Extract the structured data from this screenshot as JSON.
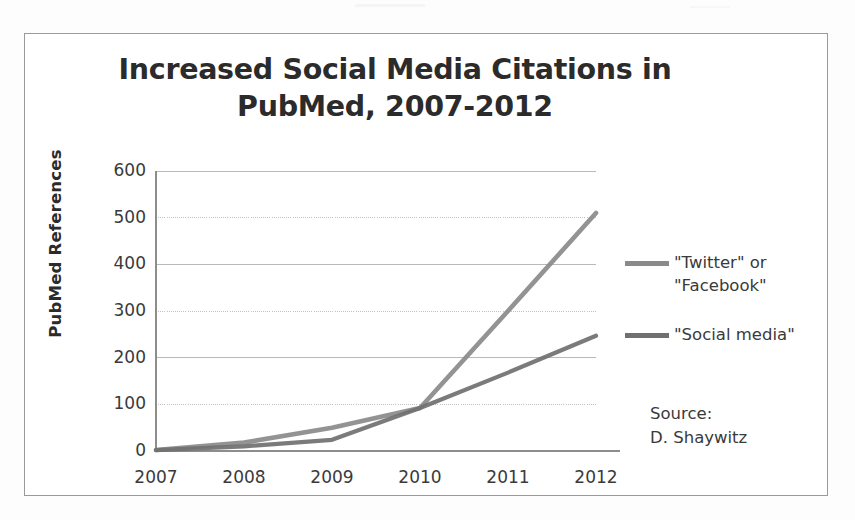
{
  "chart_data": {
    "type": "line",
    "title": "Increased Social Media Citations in PubMed, 2007-2012",
    "title_line1": "Increased Social Media Citations in",
    "title_line2": "PubMed, 2007-2012",
    "xlabel": "",
    "ylabel": "PubMed References",
    "categories": [
      "2007",
      "2008",
      "2009",
      "2010",
      "2011",
      "2012"
    ],
    "x_tick_labels": [
      "2007",
      "2008",
      "2009",
      "2010",
      "2011",
      "2012"
    ],
    "y_tick_labels": [
      "0",
      "100",
      "200",
      "300",
      "400",
      "500",
      "600"
    ],
    "y_ticks": [
      0,
      100,
      200,
      300,
      400,
      500,
      600
    ],
    "ylim": [
      0,
      600
    ],
    "grid": "horizontal",
    "legend_position": "right",
    "series": [
      {
        "name": "\"Twitter\" or \"Facebook\"",
        "label_line1": "\"Twitter\" or",
        "label_line2": "\"Facebook\"",
        "color": "#8a8a8a",
        "values": [
          2,
          18,
          50,
          92,
          300,
          510
        ]
      },
      {
        "name": "\"Social media\"",
        "label_line1": "\"Social media\"",
        "label_line2": "",
        "color": "#707070",
        "values": [
          2,
          10,
          24,
          92,
          168,
          247
        ]
      }
    ],
    "annotations": {
      "source_label": "Source:",
      "source_name": "D. Shaywitz"
    }
  },
  "colors": {
    "frame": "#9a9a9a",
    "gridline": "#b9b9b9",
    "axis": "#8d8d8d",
    "text": "#3a3a3a",
    "title": "#2b2b2b"
  }
}
